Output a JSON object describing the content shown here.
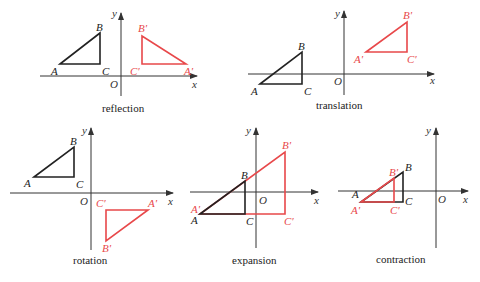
{
  "colors": {
    "original": "#222222",
    "image": "#e8484a",
    "axis": "#333333"
  },
  "panels": [
    {
      "caption": "reflection",
      "axis_labels": {
        "x": "x",
        "y": "y",
        "origin": "O"
      },
      "original": {
        "A": "A",
        "B": "B",
        "C": "C"
      },
      "image": {
        "A": "A′",
        "B": "B′",
        "C": "C′"
      }
    },
    {
      "caption": "translation",
      "axis_labels": {
        "x": "x",
        "y": "y",
        "origin": "O"
      },
      "original": {
        "A": "A",
        "B": "B",
        "C": "C"
      },
      "image": {
        "A": "A′",
        "B": "B′",
        "C": "C′"
      }
    },
    {
      "caption": "rotation",
      "axis_labels": {
        "x": "x",
        "y": "y",
        "origin": "O"
      },
      "original": {
        "A": "A",
        "B": "B",
        "C": "C"
      },
      "image": {
        "A": "A′",
        "B": "B′",
        "C": "C′"
      }
    },
    {
      "caption": "expansion",
      "axis_labels": {
        "x": "x",
        "y": "y",
        "origin": "O"
      },
      "original": {
        "A": "A",
        "B": "B",
        "C": "C"
      },
      "image": {
        "A": "A′",
        "B": "B′",
        "C": "C′"
      }
    },
    {
      "caption": "contraction",
      "axis_labels": {
        "x": "x",
        "y": "y",
        "origin": "O"
      },
      "original": {
        "A": "A",
        "B": "B",
        "C": "C"
      },
      "image": {
        "A": "A′",
        "B": "B′",
        "C": "C′"
      }
    }
  ]
}
